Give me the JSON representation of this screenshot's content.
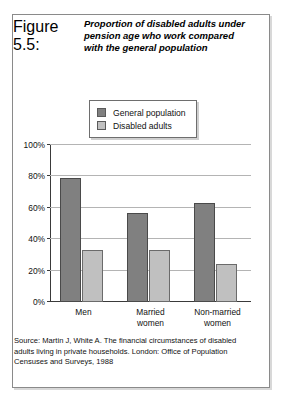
{
  "figure": {
    "number_label": "Figure 5.5:",
    "title_lines": [
      "Proportion of disabled adults under",
      "pension age who work compared",
      "with the general population"
    ]
  },
  "legend": {
    "items": [
      {
        "label": "General population",
        "color": "#808080"
      },
      {
        "label": "Disabled adults",
        "color": "#c0c0c0"
      }
    ]
  },
  "source": {
    "lines": [
      "Source: Martin J, White A. The financial circumstances of disabled",
      "adults living in private households. London: Office of Population",
      "Censuses and Surveys, 1988"
    ]
  },
  "axis": {
    "y_ticks": [
      "0%",
      "20%",
      "40%",
      "60%",
      "80%",
      "100%"
    ],
    "x_labels": [
      [
        "Men"
      ],
      [
        "Married",
        "women"
      ],
      [
        "Non-married",
        "women"
      ]
    ]
  },
  "chart_data": {
    "type": "bar",
    "title": "Proportion of disabled adults under pension age who work compared with the general population",
    "xlabel": "",
    "ylabel": "",
    "ylim": [
      0,
      100
    ],
    "ytick_values": [
      0,
      20,
      40,
      60,
      80,
      100
    ],
    "ytick_labels": [
      "0%",
      "20%",
      "40%",
      "60%",
      "80%",
      "100%"
    ],
    "grid": true,
    "legend_position": "top-center",
    "categories": [
      "Men",
      "Married women",
      "Non-married women"
    ],
    "series": [
      {
        "name": "General population",
        "color": "#808080",
        "values": [
          79,
          57,
          63
        ]
      },
      {
        "name": "Disabled adults",
        "color": "#c0c0c0",
        "values": [
          33,
          33,
          24
        ]
      }
    ]
  }
}
